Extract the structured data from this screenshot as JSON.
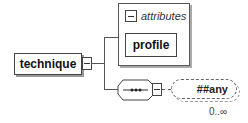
{
  "diagram": {
    "root": {
      "label": "technique",
      "toggle": "collapse"
    },
    "attributes_group": {
      "title": "attributes",
      "items": [
        {
          "label": "profile"
        }
      ]
    },
    "compositor": {
      "type": "sequence",
      "symbol": "•••"
    },
    "any_element": {
      "label": "##any",
      "occurrence": "0..∞"
    }
  },
  "colors": {
    "line": "#555555",
    "border": "#444444",
    "background": "#ffffff"
  }
}
